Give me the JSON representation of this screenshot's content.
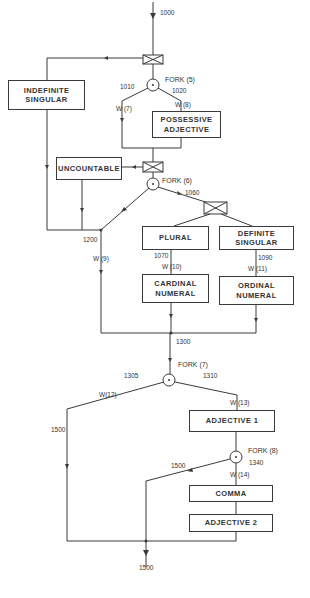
{
  "diagram": {
    "colors": {
      "line": "#3a3a3a",
      "text": "#333333",
      "background": "#ffffff"
    },
    "entry_label": "1000",
    "exit_label": "1500",
    "boxes": {
      "indefinite_singular": "INDEFINITE\nSINGULAR",
      "possessive_adjective": "POSSESSIVE\nADJECTIVE",
      "uncountable": "UNCOUNTABLE",
      "plural": "PLURAL",
      "definite_singular": "DEFINITE\nSINGULAR",
      "cardinal_numeral": "CARDINAL\nNUMERAL",
      "ordinal_numeral": "ORDINAL\nNUMERAL",
      "adjective_1": "ADJECTIVE 1",
      "comma": "COMMA",
      "adjective_2": "ADJECTIVE 2"
    },
    "forks": {
      "fork5": "FORK (5)",
      "fork6": "FORK (6)",
      "fork7": "FORK (7)",
      "fork8": "FORK (8)"
    },
    "node_labels": {
      "n1010": "1010",
      "n1020": "1020",
      "n1060": "1060",
      "n1070": "1070",
      "n1090": "1090",
      "n1200": "1200",
      "n1300": "1300",
      "n1305": "1305",
      "n1310": "1310",
      "n1340": "1340",
      "n1500_left": "1500",
      "n1500_mid": "1500"
    },
    "weights": {
      "w7": "W (7)",
      "w8": "W (8)",
      "w9": "W (9)",
      "w10": "W (10)",
      "w11": "W (11)",
      "w12": "W(12)",
      "w13": "W (13)",
      "w14": "W (14)"
    }
  }
}
